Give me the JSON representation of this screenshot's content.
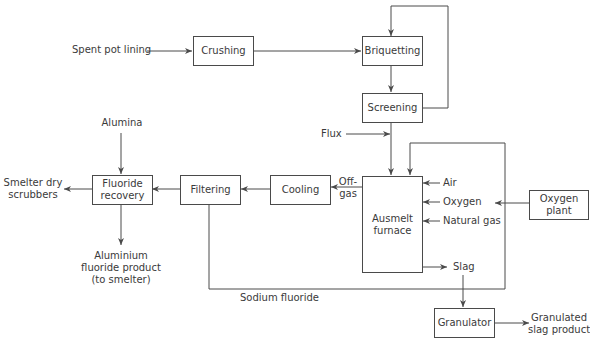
{
  "diagram": {
    "type": "process-flow",
    "nodes": {
      "crushing": "Crushing",
      "briquetting": "Briquetting",
      "screening": "Screening",
      "ausmelt_furnace": "Ausmelt furnace",
      "cooling": "Cooling",
      "filtering": "Filtering",
      "fluoride_recovery": "Fluoride recovery",
      "oxygen_plant": "Oxygen plant",
      "granulator": "Granulator"
    },
    "labels": {
      "spent_pot_lining": "Spent pot lining",
      "flux": "Flux",
      "alumina": "Alumina",
      "smelter_dry_scrubbers": "Smelter dry scrubbers",
      "aluminium_fluoride_product": "Aluminium fluoride product (to smelter)",
      "off_gas": "Off- gas",
      "air": "Air",
      "oxygen": "Oxygen",
      "natural_gas": "Natural gas",
      "slag": "Slag",
      "sodium_fluoride": "Sodium fluoride",
      "granulated_slag_product": "Granulated slag product"
    },
    "edges": [
      {
        "from": "Spent pot lining",
        "to": "Crushing"
      },
      {
        "from": "Crushing",
        "to": "Briquetting"
      },
      {
        "from": "Briquetting",
        "to": "Screening"
      },
      {
        "from": "Screening",
        "to": "Briquetting",
        "note": "recycle"
      },
      {
        "from": "Screening",
        "to": "Ausmelt furnace"
      },
      {
        "from": "Flux",
        "to": "Ausmelt furnace"
      },
      {
        "from": "Air",
        "to": "Ausmelt furnace"
      },
      {
        "from": "Oxygen",
        "to": "Ausmelt furnace"
      },
      {
        "from": "Natural gas",
        "to": "Ausmelt furnace"
      },
      {
        "from": "Oxygen plant",
        "to": "Oxygen"
      },
      {
        "from": "Ausmelt furnace",
        "to": "Cooling",
        "label": "Off-gas"
      },
      {
        "from": "Cooling",
        "to": "Filtering"
      },
      {
        "from": "Filtering",
        "to": "Fluoride recovery"
      },
      {
        "from": "Filtering",
        "to": "Ausmelt furnace",
        "label": "Sodium fluoride"
      },
      {
        "from": "Alumina",
        "to": "Fluoride recovery"
      },
      {
        "from": "Fluoride recovery",
        "to": "Smelter dry scrubbers"
      },
      {
        "from": "Fluoride recovery",
        "to": "Aluminium fluoride product (to smelter)"
      },
      {
        "from": "Ausmelt furnace",
        "to": "Slag"
      },
      {
        "from": "Slag",
        "to": "Granulator"
      },
      {
        "from": "Granulator",
        "to": "Granulated slag product"
      }
    ]
  },
  "text": {
    "crushing": "Crushing",
    "briquetting": "Briquetting",
    "screening": "Screening",
    "ausmelt_1": "Ausmelt",
    "ausmelt_2": "furnace",
    "cooling": "Cooling",
    "filtering": "Filtering",
    "fluoride_1": "Fluoride",
    "fluoride_2": "recovery",
    "oxygen_plant_1": "Oxygen",
    "oxygen_plant_2": "plant",
    "granulator": "Granulator",
    "spent_pot_lining": "Spent pot lining",
    "flux": "Flux",
    "alumina": "Alumina",
    "smelter_1": "Smelter dry",
    "smelter_2": "scrubbers",
    "alf_1": "Aluminium",
    "alf_2": "fluoride product",
    "alf_3": "(to smelter)",
    "offgas_1": "Off-",
    "offgas_2": "gas",
    "air": "Air",
    "oxygen": "Oxygen",
    "natural_gas": "Natural gas",
    "slag": "Slag",
    "sodium_fluoride": "Sodium fluoride",
    "gsp_1": "Granulated",
    "gsp_2": "slag product"
  },
  "colors": {
    "line": "#4a4a4a",
    "text": "#3a3a3a",
    "background": "#ffffff"
  }
}
